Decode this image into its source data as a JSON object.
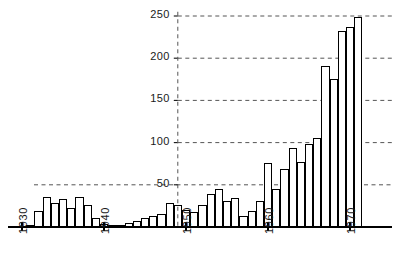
{
  "chart_data": {
    "type": "bar",
    "title": "",
    "subtitle": "",
    "xlabel": "",
    "ylabel": "",
    "xlim": [
      1929.5,
      1973.5
    ],
    "ylim": [
      0,
      255
    ],
    "grid": true,
    "grid_style": "dashed-horizontal",
    "legend": "none",
    "bar_fill": "#ffffff",
    "bar_stroke": "#000000",
    "axis_color": "#000000",
    "grid_color": "#555555",
    "yticks": [
      50,
      100,
      150,
      200,
      250
    ],
    "ytick_labels": [
      "50",
      "100",
      "150",
      "200",
      "250"
    ],
    "xticks": [
      1930,
      1940,
      1950,
      1960,
      1970
    ],
    "xtick_labels": [
      "1930",
      "1940",
      "1950",
      "1960",
      "1970"
    ],
    "yaxis_line_at_x": 1949,
    "categories": [
      1930,
      1931,
      1932,
      1933,
      1934,
      1935,
      1936,
      1937,
      1938,
      1939,
      1940,
      1941,
      1942,
      1943,
      1944,
      1945,
      1946,
      1947,
      1948,
      1949,
      1950,
      1951,
      1952,
      1953,
      1954,
      1955,
      1956,
      1957,
      1958,
      1959,
      1960,
      1961,
      1962,
      1963,
      1964,
      1965,
      1966,
      1967,
      1968,
      1969,
      1970,
      1971,
      1972
    ],
    "values": [
      1,
      2,
      18,
      35,
      28,
      32,
      22,
      35,
      25,
      10,
      3,
      2,
      2,
      4,
      6,
      10,
      13,
      15,
      28,
      26,
      20,
      17,
      25,
      38,
      45,
      30,
      34,
      12,
      18,
      30,
      75,
      45,
      68,
      93,
      77,
      98,
      105,
      190,
      175,
      232,
      236,
      248,
      0
    ]
  },
  "axes": {
    "y_tick_text": [
      "250",
      "200",
      "150",
      "100",
      "50"
    ],
    "x_tick_text": [
      "1930",
      "1940",
      "1950",
      "1960",
      "1970"
    ]
  }
}
